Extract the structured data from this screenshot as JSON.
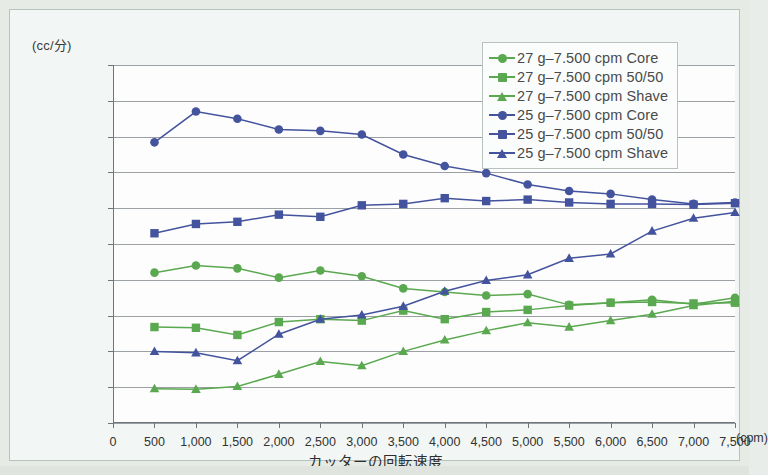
{
  "figure": {
    "y_axis_unit": "(cc/分)",
    "x_axis_unit": "(cpm)",
    "x_axis_title": "カッターの回転速度"
  },
  "colors": {
    "green": "#5aa84f",
    "green_dark": "#4e9a46",
    "blue": "#44539d",
    "blue_dark": "#3d4b92",
    "grid": "#9aa0a4",
    "axis": "#6e7478",
    "plot_bg": "#fdfdfd",
    "figure_bg": "#f2f6f4",
    "page_bg": "#e7ebe6",
    "frame": "#b9c3bd"
  },
  "legend": {
    "position": "top-right",
    "items": [
      {
        "label": "27 g–7.500 cpm Core",
        "color": "#5aa84f",
        "marker": "circle"
      },
      {
        "label": "27 g–7.500 cpm 50/50",
        "color": "#5aa84f",
        "marker": "square"
      },
      {
        "label": "27 g–7.500 cpm Shave",
        "color": "#5aa84f",
        "marker": "triangle"
      },
      {
        "label": "25 g–7.500 cpm Core",
        "color": "#44539d",
        "marker": "circle"
      },
      {
        "label": "25 g–7.500 cpm 50/50",
        "color": "#44539d",
        "marker": "square"
      },
      {
        "label": "25 g–7.500 cpm Shave",
        "color": "#44539d",
        "marker": "triangle"
      }
    ]
  },
  "chart_data": {
    "type": "line",
    "title": "",
    "xlabel": "カッターの回転速度",
    "ylabel": "(cc/分)",
    "xunit": "(cpm)",
    "yunit": "(cc/分)",
    "grid": true,
    "legend_position": "top-right",
    "xlim": [
      0,
      7500
    ],
    "ylim": [
      0,
      5.0
    ],
    "ytick_step": 0.5,
    "xtick_step": 500,
    "xticks": [
      0,
      500,
      1000,
      1500,
      2000,
      2500,
      3000,
      3500,
      4000,
      4500,
      5000,
      5500,
      6000,
      6500,
      7000,
      7500
    ],
    "xtick_labels": [
      "0",
      "500",
      "1,000",
      "1,500",
      "2,000",
      "2,500",
      "3,000",
      "3,500",
      "4,000",
      "4,500",
      "5,000",
      "5,500",
      "6,000",
      "6,500",
      "7,000",
      "7,500"
    ],
    "yticks": [
      0,
      0.5,
      1.0,
      1.5,
      2.0,
      2.5,
      3.0,
      3.5,
      4.0,
      4.5,
      5.0
    ],
    "ytick_labels": [
      "0.00",
      "0.50",
      "1.00",
      "1.50",
      "2.00",
      "2.50",
      "3.00",
      "3.50",
      "4.00",
      "4.50",
      "5.00"
    ],
    "x": [
      500,
      1000,
      1500,
      2000,
      2500,
      3000,
      3500,
      4000,
      4500,
      5000,
      5500,
      6000,
      6500,
      7000,
      7500
    ],
    "series": [
      {
        "name": "27 g–7.500 cpm Core",
        "color": "#5aa84f",
        "marker": "circle",
        "values": [
          2.1,
          2.2,
          2.16,
          2.03,
          2.13,
          2.05,
          1.88,
          1.83,
          1.78,
          1.8,
          1.65,
          1.68,
          1.72,
          1.66,
          1.75
        ]
      },
      {
        "name": "27 g–7.500 cpm 50/50",
        "color": "#5aa84f",
        "marker": "square",
        "values": [
          1.34,
          1.33,
          1.23,
          1.41,
          1.45,
          1.43,
          1.57,
          1.45,
          1.55,
          1.58,
          1.64,
          1.68,
          1.69,
          1.67,
          1.68
        ]
      },
      {
        "name": "27 g–7.500 cpm Shave",
        "color": "#5aa84f",
        "marker": "triangle",
        "values": [
          0.48,
          0.47,
          0.51,
          0.68,
          0.86,
          0.8,
          1.0,
          1.16,
          1.29,
          1.4,
          1.34,
          1.43,
          1.52,
          1.64,
          1.7
        ]
      },
      {
        "name": "25 g–7.500 cpm Core",
        "color": "#44539d",
        "marker": "circle",
        "values": [
          3.92,
          4.35,
          4.25,
          4.1,
          4.08,
          4.03,
          3.75,
          3.59,
          3.49,
          3.33,
          3.24,
          3.2,
          3.12,
          3.06,
          3.08
        ]
      },
      {
        "name": "25 g–7.500 cpm 50/50",
        "color": "#44539d",
        "marker": "square",
        "values": [
          2.65,
          2.78,
          2.81,
          2.91,
          2.88,
          3.04,
          3.06,
          3.14,
          3.1,
          3.12,
          3.08,
          3.06,
          3.06,
          3.05,
          3.07
        ]
      },
      {
        "name": "25 g–7.500 cpm Shave",
        "color": "#44539d",
        "marker": "triangle",
        "values": [
          1.0,
          0.98,
          0.87,
          1.24,
          1.45,
          1.51,
          1.63,
          1.84,
          1.99,
          2.07,
          2.3,
          2.36,
          2.68,
          2.86,
          2.94
        ]
      }
    ]
  }
}
